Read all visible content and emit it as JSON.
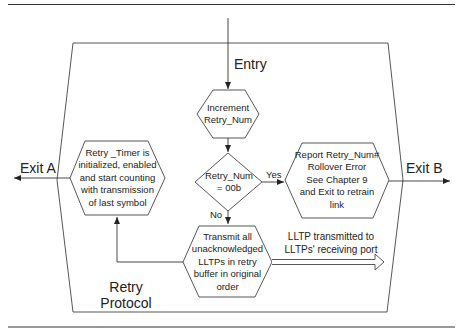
{
  "diagram": {
    "title": "Retry Protocol",
    "title_lines": [
      "Retry",
      "Protocol"
    ],
    "entry_label": "Entry",
    "exit_a_label": "Exit A",
    "exit_b_label": "Exit B",
    "nodes": {
      "increment": {
        "shape": "hexagon",
        "lines": [
          "Increment",
          "Retry_Num"
        ]
      },
      "decision": {
        "shape": "diamond",
        "lines": [
          "Retry_Num",
          "= 00b"
        ]
      },
      "report": {
        "shape": "hexagon",
        "lines": [
          "Report Retry_Num#",
          "Rollover Error",
          "See Chapter 9",
          "and Exit to retrain",
          "link"
        ]
      },
      "timer": {
        "shape": "hexagon",
        "lines": [
          "Retry _Timer is",
          "initialized, enabled",
          "and start counting",
          "with transmission",
          "of last symbol"
        ]
      },
      "transmit": {
        "shape": "hexagon",
        "lines": [
          "Transmit all",
          "unacknowledged",
          "LLTPs in retry",
          "buffer in original",
          "order"
        ]
      }
    },
    "edges": {
      "yes_label": "Yes",
      "no_label": "No",
      "output_label_lines": [
        "LLTP transmitted to",
        "LLTPs' receiving port"
      ]
    },
    "colors": {
      "line": "#333333",
      "text": "#222222",
      "background": "#ffffff"
    }
  }
}
